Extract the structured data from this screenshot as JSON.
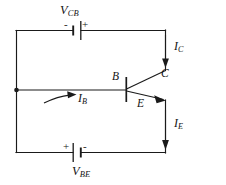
{
  "figure": {
    "kind": "circuit-diagram",
    "background_color": "#ffffff",
    "ink_color": "#1a1a1a"
  },
  "labels": {
    "v_cb": {
      "symbol": "V",
      "subscript": "CB"
    },
    "v_be": {
      "symbol": "V",
      "subscript": "BE"
    },
    "i_c": {
      "symbol": "I",
      "subscript": "C"
    },
    "i_e": {
      "symbol": "I",
      "subscript": "E"
    },
    "i_b": {
      "symbol": "I",
      "subscript": "B"
    },
    "terminal_base": "B",
    "terminal_collector": "C",
    "terminal_emitter": "E"
  },
  "polarity": {
    "top_battery_left": "-",
    "top_battery_right": "+",
    "bottom_battery_left": "+",
    "bottom_battery_right": "-"
  },
  "components": {
    "top_battery": {
      "name": "V_CB source",
      "orientation": "vertical-plates"
    },
    "bottom_battery": {
      "name": "V_BE source",
      "orientation": "vertical-plates"
    },
    "transistor": {
      "name": "NPN transistor",
      "emitter_arrow": "outward"
    },
    "base_node": {
      "name": "base junction dot"
    }
  },
  "currents": [
    {
      "name": "I_C",
      "direction": "down",
      "branch": "collector-right-rail"
    },
    {
      "name": "I_E",
      "direction": "down",
      "branch": "emitter-right-rail"
    },
    {
      "name": "I_B",
      "direction": "right",
      "branch": "base-wire"
    }
  ]
}
